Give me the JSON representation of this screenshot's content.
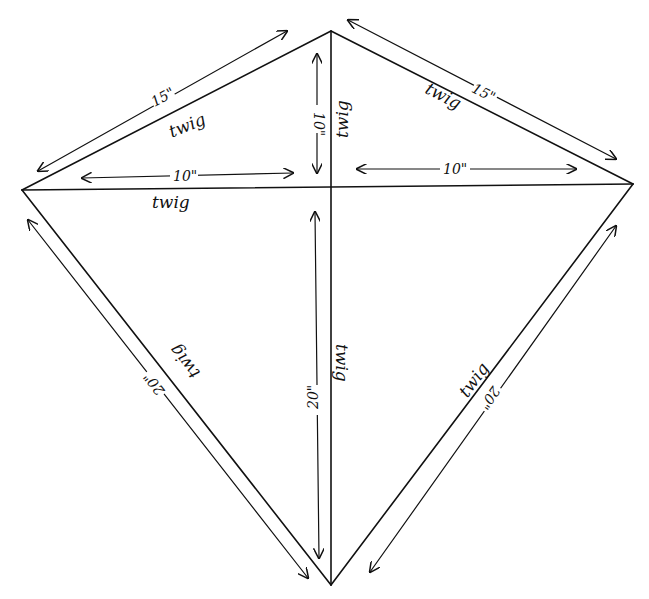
{
  "diagram": {
    "type": "kite-plan",
    "background": "#ffffff",
    "ink": "#111111",
    "points": {
      "top": [
        331,
        31
      ],
      "left": [
        22,
        190
      ],
      "right": [
        633,
        184
      ],
      "bottom": [
        331,
        585
      ],
      "center": [
        331,
        188
      ]
    },
    "edges": [
      {
        "id": "top-left",
        "label": "twig",
        "dimension": "15\""
      },
      {
        "id": "top-right",
        "label": "twig",
        "dimension": "15\""
      },
      {
        "id": "left-bottom",
        "label": "twig",
        "dimension": "20\""
      },
      {
        "id": "right-bottom",
        "label": "twig",
        "dimension": "20\""
      },
      {
        "id": "cross-spar",
        "label": "twig"
      },
      {
        "id": "spine",
        "label": "twig"
      }
    ],
    "dimensions": {
      "top_left": "15\"",
      "top_right": "15\"",
      "left_half_spar": "10\"",
      "right_half_spar": "10\"",
      "upper_spine": "10\"",
      "lower_spine": "20\"",
      "bottom_left": "20\"",
      "bottom_right": "20\""
    },
    "labels": {
      "twig": "twig"
    }
  }
}
